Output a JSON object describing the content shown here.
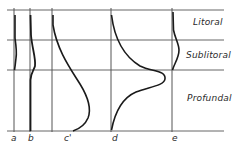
{
  "diagram": {
    "zones": [
      {
        "label": "Litoral",
        "top": 10,
        "bottom": 40
      },
      {
        "label": "Sublitoral",
        "top": 40,
        "bottom": 70
      },
      {
        "label": "Profundal",
        "top": 70,
        "bottom": 131
      }
    ],
    "profiles": [
      {
        "label": "a",
        "x": 14
      },
      {
        "label": "b",
        "x": 30
      },
      {
        "label": "c'",
        "x": 52
      },
      {
        "label": "d",
        "x": 111
      },
      {
        "label": "e",
        "x": 172
      }
    ],
    "colors": {
      "line": "#555555",
      "curve": "#1a1a1a",
      "text": "#2a2a2a"
    }
  }
}
